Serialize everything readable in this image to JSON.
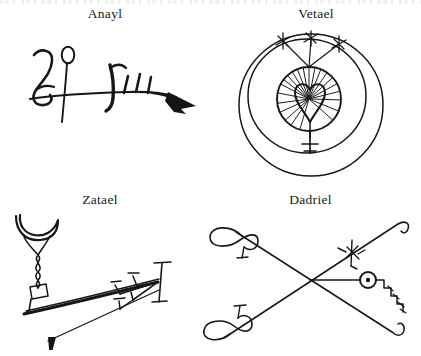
{
  "page": {
    "background_color": "#ffffff",
    "ink_color": "#171717",
    "top_cropped_text_row": true,
    "layout": "2x2 grid of labelled hand-drawn sigils",
    "width": 421,
    "height": 356
  },
  "sigils": [
    {
      "id": "anayl",
      "label": "Anayl",
      "position": "top-left",
      "description": "Horizontal hand-drawn sigil: curved hook resembling a figure-2 or Jupiter glyph at left, a tall vertical stem topped by a small open oval loop, a long horizontal baseline stroke, a bold hooked stroke, three short hatch strokes, ending in a solid black wedge-shaped arrowhead at right",
      "elements": [
        "jupiter-hook",
        "vertical-stem-with-loop",
        "horizontal-baseline",
        "bold-hook",
        "hatch-marks",
        "black-wedge-tip"
      ]
    },
    {
      "id": "vetael",
      "label": "Vetael",
      "position": "top-right",
      "description": "Concentric circle sigil: three offset hand-drawn circles, an inner disc filled with radiating hatch lines containing a heart or leaf outline, a Venus-like cross stem descending below the disc, and three rays rising from the disc to three small asterisk star marks",
      "elements": [
        "outer-circle",
        "middle-circle",
        "inner-hatched-disc",
        "heart-outline",
        "venus-cross-stem",
        "three-rays",
        "three-star-marks"
      ]
    },
    {
      "id": "zatael",
      "label": "Zatael",
      "position": "bottom-left",
      "description": "Hand-drawn sigil: crescent cup on a twisted hourglass stem with a small rectangle at left, a long thick diagonal stroke rising to the right, a cluster of barbed feather strokes with T-shaped cross ends at the right terminus, and a thin line descending left to a solid black triangular pennant",
      "elements": [
        "crescent-cup",
        "twisted-stem",
        "small-rectangle",
        "long-diagonal-stroke",
        "barbed-feathers",
        "t-bar-terminal",
        "black-triangle-pennant"
      ]
    },
    {
      "id": "dadriel",
      "label": "Dadriel",
      "position": "bottom-right",
      "description": "Large X formed by two long crossing strokes; looped infinity bows terminate the upper-left and lower-left arms, small hooks terminate the right arms, a barbed cross mark sits on the upper-right arm, and a horizontal stroke runs right from the crossing point to a circled dot followed by a descending hatched zigzag",
      "elements": [
        "diagonal-stroke-a",
        "diagonal-stroke-b",
        "infinity-bow-upper-left",
        "infinity-bow-lower-left",
        "barbed-cross-mark",
        "horizontal-stroke",
        "circled-dot",
        "hatched-zigzag",
        "hook-terminals"
      ]
    }
  ]
}
